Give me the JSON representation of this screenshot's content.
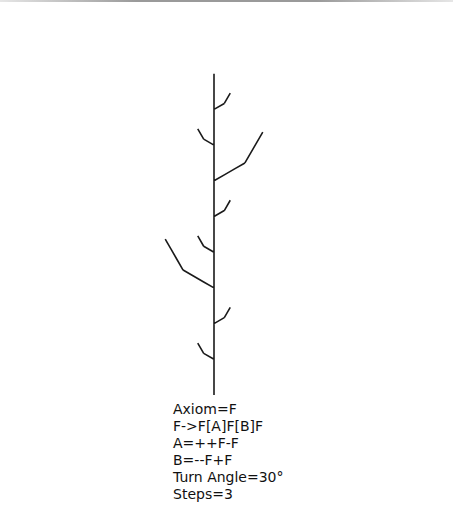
{
  "lsystem": {
    "axiom": "F",
    "rules": {
      "F": "F[A]F[B]F",
      "A": "++F-F",
      "B": "--F+F"
    },
    "angle_deg": 30,
    "steps": 3,
    "origin": [
      214,
      395
    ],
    "segment_length": 11.9,
    "stroke_color": "#1a1a1a",
    "stroke_width": 1.6
  },
  "legend": {
    "lines": [
      "Axiom=F",
      "F->F[A]F[B]F",
      "A=++F-F",
      "B=--F+F",
      "Turn Angle=30°",
      "Steps=3"
    ]
  }
}
